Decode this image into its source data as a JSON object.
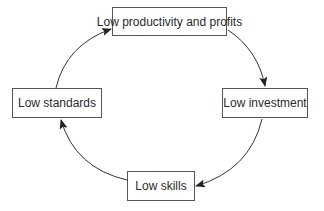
{
  "diagram": {
    "type": "cycle",
    "nodes": [
      {
        "id": "top",
        "label": "Low productivity and profits"
      },
      {
        "id": "right",
        "label": "Low investment"
      },
      {
        "id": "bottom",
        "label": "Low skills"
      },
      {
        "id": "left",
        "label": "Low standards"
      }
    ],
    "edges": [
      {
        "from": "top",
        "to": "right"
      },
      {
        "from": "right",
        "to": "bottom"
      },
      {
        "from": "bottom",
        "to": "left"
      },
      {
        "from": "left",
        "to": "top"
      }
    ],
    "colors": {
      "stroke": "#333333",
      "box_border": "#555555",
      "text": "#2a2a2a"
    }
  }
}
